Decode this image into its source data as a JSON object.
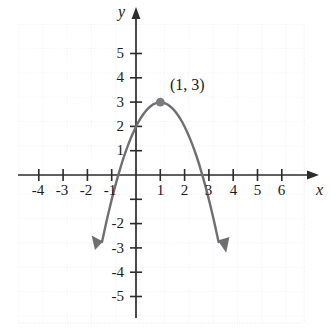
{
  "figure": {
    "background_color": "#ffffff",
    "grid_color": "#e3e3e8",
    "axis_color": "#2b2b2b",
    "curve_color": "#6e6e73",
    "point_color": "#7a7a80",
    "label_color": "#1a1a1a"
  },
  "axes": {
    "x_name": "x",
    "y_name": "y",
    "x_ticks": [
      "-4",
      "-3",
      "-2",
      "-1",
      "1",
      "2",
      "3",
      "4",
      "5",
      "6"
    ],
    "x_tick_values": [
      -4,
      -3,
      -2,
      -1,
      1,
      2,
      3,
      4,
      5,
      6
    ],
    "y_ticks": [
      "5",
      "4",
      "3",
      "2",
      "1",
      "-2",
      "-3",
      "-4",
      "-5"
    ],
    "y_tick_values": [
      5,
      4,
      3,
      2,
      1,
      -2,
      -3,
      -4,
      -5
    ]
  },
  "annotations": {
    "vertex_label": "(1, 3)"
  },
  "chart_data": {
    "type": "line",
    "title": "",
    "xlabel": "x",
    "ylabel": "y",
    "xlim": [
      -4.9,
      7.0
    ],
    "ylim": [
      -5.9,
      6.2
    ],
    "grid": true,
    "legend": "none",
    "equation": "y = -(x - 1)^2 + 3",
    "vertex": {
      "x": 1,
      "y": 3,
      "label": "(1, 3)",
      "marked": true
    },
    "x_intercepts": [
      -0.73,
      2.73
    ],
    "y_intercept": 2,
    "opens": "down",
    "curve_domain": [
      -1.6,
      4.0
    ],
    "arrow_ends": [
      "left-down",
      "right-down"
    ],
    "x": [
      -1.6,
      -1.4,
      -1.2,
      -1.0,
      -0.8,
      -0.6,
      -0.4,
      -0.2,
      0.0,
      0.2,
      0.4,
      0.6,
      0.8,
      1.0,
      1.2,
      1.4,
      1.6,
      1.8,
      2.0,
      2.2,
      2.4,
      2.6,
      2.8,
      3.0,
      3.2,
      3.4,
      3.6,
      3.8,
      4.0
    ],
    "y": [
      -3.76,
      -2.76,
      -1.84,
      -1.0,
      -0.24,
      0.44,
      1.04,
      1.56,
      2.0,
      2.36,
      2.64,
      2.84,
      2.96,
      3.0,
      2.96,
      2.84,
      2.64,
      2.36,
      2.0,
      1.56,
      1.04,
      0.44,
      -0.24,
      -1.0,
      -1.84,
      -2.76,
      -3.76,
      -4.84,
      -6.0
    ]
  }
}
